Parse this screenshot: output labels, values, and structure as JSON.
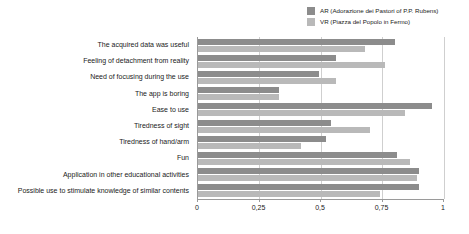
{
  "chart_data": {
    "type": "bar",
    "orientation": "horizontal",
    "title": "",
    "xlabel": "",
    "ylabel": "",
    "xlim": [
      0,
      1
    ],
    "grid": true,
    "legend_position": "top-right",
    "xticks": [
      "0",
      "0,25",
      "0,5",
      "0,75",
      "1"
    ],
    "xtick_values": [
      0,
      0.25,
      0.5,
      0.75,
      1
    ],
    "categories": [
      "The acquired data was useful",
      "Feeling of detachment from reality",
      "Need of focusing during the use",
      "The app is boring",
      "Ease to use",
      "Tiredness of sight",
      "Tiredness of hand/arm",
      "Fun",
      "Application in other educational activities",
      "Possible use to stimulate knowledge of similar contents"
    ],
    "series": [
      {
        "name": "AR (Adorazione dei Pastori of P.P. Rubens)",
        "short_name": "AR",
        "color": "#8c8c8c",
        "values": [
          0.8,
          0.56,
          0.49,
          0.33,
          0.95,
          0.54,
          0.52,
          0.81,
          0.9,
          0.9
        ]
      },
      {
        "name": "VR (Piazza del Popolo in Fermo)",
        "short_name": "VR",
        "color": "#b9b9b9",
        "values": [
          0.68,
          0.76,
          0.56,
          0.33,
          0.84,
          0.7,
          0.42,
          0.86,
          0.89,
          0.74
        ]
      }
    ]
  }
}
